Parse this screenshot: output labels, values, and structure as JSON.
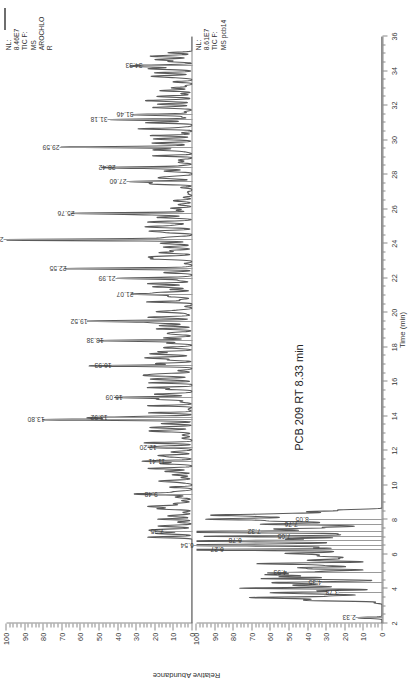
{
  "figure": {
    "annotation": "PCB 209 RT 8.33 min",
    "y_axis_title": "Relative Abundance",
    "x_axis_title": "Time (min)"
  },
  "panels": [
    {
      "id": "top",
      "name": "aroclor-panel",
      "nl_label": "NL:\n8.46E7\nTIC F:\nMS\nAROCHLO\nR",
      "nl_value": "8.46E7",
      "tic_line1": "TIC F:",
      "tic_line2": "MS",
      "sample": "AROCHLOR",
      "y_ticks": [
        0,
        10,
        20,
        30,
        40,
        50,
        60,
        70,
        80,
        90,
        100
      ],
      "peaks": [
        {
          "rt": 7.35,
          "label": "7.35",
          "h": 14
        },
        {
          "rt": 9.48,
          "label": "9.48",
          "h": 17
        },
        {
          "rt": 11.41,
          "label": "11.41",
          "h": 13
        },
        {
          "rt": 12.2,
          "label": "12.20",
          "h": 18
        },
        {
          "rt": 13.8,
          "label": "13.80",
          "h": 78
        },
        {
          "rt": 13.92,
          "label": "13.92",
          "h": 44
        },
        {
          "rt": 15.09,
          "label": "15.09",
          "h": 36
        },
        {
          "rt": 16.93,
          "label": "16.93",
          "h": 42
        },
        {
          "rt": 18.38,
          "label": "18.38",
          "h": 46
        },
        {
          "rt": 19.52,
          "label": "19.52",
          "h": 55
        },
        {
          "rt": 21.07,
          "label": "21.07",
          "h": 30
        },
        {
          "rt": 21.99,
          "label": "21.99",
          "h": 40
        },
        {
          "rt": 22.55,
          "label": "22.55",
          "h": 66
        },
        {
          "rt": 24.22,
          "label": "24.22",
          "h": 100
        },
        {
          "rt": 25.76,
          "label": "25.76",
          "h": 62
        },
        {
          "rt": 27.6,
          "label": "27.60",
          "h": 34
        },
        {
          "rt": 28.42,
          "label": "28.42",
          "h": 40
        },
        {
          "rt": 29.59,
          "label": "29.59",
          "h": 70
        },
        {
          "rt": 31.18,
          "label": "31.18",
          "h": 44
        },
        {
          "rt": 31.46,
          "label": "31.46",
          "h": 30
        },
        {
          "rt": 34.33,
          "label": "34.33",
          "h": 25
        }
      ]
    },
    {
      "id": "bottom",
      "name": "pcb-panel",
      "nl_label": "NL:\n8.61E7\nTIC F:\nMS pcb14",
      "nl_value": "8.61E7",
      "tic_line1": "TIC F:",
      "tic_line2": "MS pcb14",
      "sample": "pcb14",
      "y_ticks": [
        0,
        10,
        20,
        30,
        40,
        50,
        60,
        70,
        80,
        90,
        100
      ],
      "peaks": [
        {
          "rt": 2.33,
          "label": "2.33",
          "h": 13
        },
        {
          "rt": 3.78,
          "label": "3.78",
          "h": 22
        },
        {
          "rt": 4.35,
          "label": "4.35",
          "h": 31
        },
        {
          "rt": 4.93,
          "label": "4.93",
          "h": 50
        },
        {
          "rt": 6.27,
          "label": "6.27",
          "h": 84
        },
        {
          "rt": 6.54,
          "label": "6.54",
          "h": 100
        },
        {
          "rt": 6.78,
          "label": "6.78",
          "h": 74
        },
        {
          "rt": 7.05,
          "label": "7.05",
          "h": 48
        },
        {
          "rt": 7.32,
          "label": "7.32",
          "h": 64
        },
        {
          "rt": 7.76,
          "label": "7.76",
          "h": 44
        },
        {
          "rt": 8.05,
          "label": "8.05",
          "h": 38
        }
      ]
    }
  ],
  "chart_data": {
    "type": "line",
    "xlabel": "Time (min)",
    "ylabel": "Relative Abundance",
    "xlim": [
      2,
      36
    ],
    "ylim": [
      0,
      100
    ],
    "grid": false,
    "legend": "none",
    "x_ticks": [
      2,
      4,
      6,
      8,
      10,
      12,
      14,
      16,
      18,
      20,
      22,
      24,
      26,
      28,
      30,
      32,
      34,
      36
    ],
    "y_ticks": [
      0,
      10,
      20,
      30,
      40,
      50,
      60,
      70,
      80,
      90,
      100
    ],
    "annotations": [
      "PCB 209 RT 8.33 min"
    ],
    "series": [
      {
        "name": "AROCHLOR",
        "nl": "8.46E7",
        "x": [
          7.35,
          9.48,
          11.41,
          12.2,
          13.8,
          13.92,
          15.09,
          16.93,
          18.38,
          19.52,
          21.07,
          21.99,
          22.55,
          24.22,
          25.76,
          27.6,
          28.42,
          29.59,
          31.18,
          31.46,
          34.33
        ],
        "values": [
          14,
          17,
          13,
          18,
          78,
          44,
          36,
          42,
          46,
          55,
          30,
          40,
          66,
          100,
          62,
          34,
          40,
          70,
          44,
          30,
          25
        ]
      },
      {
        "name": "pcb14",
        "nl": "8.61E7",
        "x": [
          2.33,
          3.78,
          4.35,
          4.93,
          6.27,
          6.54,
          6.78,
          7.05,
          7.32,
          7.76,
          8.05
        ],
        "values": [
          13,
          22,
          31,
          50,
          84,
          100,
          74,
          48,
          64,
          44,
          38
        ]
      }
    ]
  }
}
